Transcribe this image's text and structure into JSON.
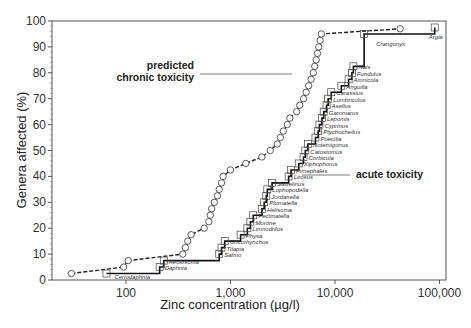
{
  "chart_data": {
    "type": "line",
    "title": "",
    "xlabel": "Zinc concentration (µg/l)",
    "ylabel": "Genera affected (%)",
    "xscale": "log",
    "xlim": [
      20,
      100000
    ],
    "ylim": [
      0,
      100
    ],
    "x_ticks": [
      100,
      1000,
      10000,
      100000
    ],
    "x_tick_labels": [
      "100",
      "1,000",
      "10,000",
      "100,000"
    ],
    "y_ticks": [
      0,
      10,
      20,
      30,
      40,
      50,
      60,
      70,
      80,
      90,
      100
    ],
    "y_tick_labels": [
      "0",
      "10",
      "20",
      "30",
      "40",
      "50",
      "60",
      "70",
      "80",
      "90",
      "100"
    ],
    "grid": false,
    "legend": "none",
    "annotations": [
      {
        "text": "predicted\nchronic toxicity",
        "target_series": "predicted chronic toxicity"
      },
      {
        "text": "acute toxicity",
        "target_series": "acute toxicity"
      }
    ],
    "series": [
      {
        "name": "acute toxicity",
        "style": "solid line, square markers",
        "points": [
          {
            "genus": "Ceriodaphnia",
            "x": 65,
            "y": 2.5
          },
          {
            "genus": "Daphnia",
            "x": 210,
            "y": 5
          },
          {
            "genus": "Aeolosoma",
            "x": 230,
            "y": 7.5
          },
          {
            "genus": "Salmo",
            "x": 780,
            "y": 10
          },
          {
            "genus": "Tilapia",
            "x": 820,
            "y": 12.5
          },
          {
            "genus": "Oncorhynchus",
            "x": 880,
            "y": 15
          },
          {
            "genus": "Physa",
            "x": 1250,
            "y": 17.5
          },
          {
            "genus": "Limnodrilus",
            "x": 1450,
            "y": 20
          },
          {
            "genus": "Morone",
            "x": 1550,
            "y": 22.5
          },
          {
            "genus": "Pectinatella",
            "x": 1650,
            "y": 25
          },
          {
            "genus": "Helisoma",
            "x": 2000,
            "y": 27.5
          },
          {
            "genus": "Plumatella",
            "x": 2100,
            "y": 30
          },
          {
            "genus": "Jordanella",
            "x": 2200,
            "y": 32.5
          },
          {
            "genus": "Lophopodella",
            "x": 2250,
            "y": 35
          },
          {
            "genus": "Salvelinus",
            "x": 2500,
            "y": 37.5
          },
          {
            "genus": "Lirceus",
            "x": 3600,
            "y": 40
          },
          {
            "genus": "Pimephales",
            "x": 3800,
            "y": 42.5
          },
          {
            "genus": "Xiphophorus",
            "x": 4500,
            "y": 45
          },
          {
            "genus": "Corbicula",
            "x": 5000,
            "y": 47.5
          },
          {
            "genus": "Catostomus",
            "x": 5200,
            "y": 50
          },
          {
            "genus": "Notemigonus",
            "x": 5500,
            "y": 52.5
          },
          {
            "genus": "Poecilia",
            "x": 6500,
            "y": 55
          },
          {
            "genus": "Ptychocheilus",
            "x": 6900,
            "y": 57.5
          },
          {
            "genus": "Cyprinus",
            "x": 7100,
            "y": 60
          },
          {
            "genus": "Lepomis",
            "x": 7500,
            "y": 62.5
          },
          {
            "genus": "Gammarus",
            "x": 7800,
            "y": 65
          },
          {
            "genus": "Asellus",
            "x": 8300,
            "y": 67.5
          },
          {
            "genus": "Lumbriculus",
            "x": 8600,
            "y": 70
          },
          {
            "genus": "Carassius",
            "x": 9200,
            "y": 72.5
          },
          {
            "genus": "Anguilla",
            "x": 11500,
            "y": 75
          },
          {
            "genus": "Amnicola",
            "x": 13500,
            "y": 77.5
          },
          {
            "genus": "Fundulus",
            "x": 14500,
            "y": 80
          },
          {
            "genus": "Nais",
            "x": 15000,
            "y": 82.5
          },
          {
            "genus": "Crangonyx",
            "x": 19000,
            "y": 95
          },
          {
            "genus": "Argia",
            "x": 90000,
            "y": 97.5
          }
        ]
      },
      {
        "name": "predicted chronic toxicity",
        "style": "dashed line, circle markers",
        "points": [
          {
            "x": 30,
            "y": 2.5
          },
          {
            "x": 95,
            "y": 5
          },
          {
            "x": 105,
            "y": 7.5
          },
          {
            "x": 350,
            "y": 10
          },
          {
            "x": 370,
            "y": 12.5
          },
          {
            "x": 390,
            "y": 15
          },
          {
            "x": 420,
            "y": 17.5
          },
          {
            "x": 560,
            "y": 20
          },
          {
            "x": 620,
            "y": 22.5
          },
          {
            "x": 640,
            "y": 25
          },
          {
            "x": 660,
            "y": 27.5
          },
          {
            "x": 700,
            "y": 30
          },
          {
            "x": 750,
            "y": 32.5
          },
          {
            "x": 780,
            "y": 35
          },
          {
            "x": 820,
            "y": 37.5
          },
          {
            "x": 850,
            "y": 40
          },
          {
            "x": 1000,
            "y": 42.5
          },
          {
            "x": 1400,
            "y": 45
          },
          {
            "x": 2000,
            "y": 47.5
          },
          {
            "x": 2400,
            "y": 50
          },
          {
            "x": 2800,
            "y": 52.5
          },
          {
            "x": 3000,
            "y": 55
          },
          {
            "x": 3200,
            "y": 57.5
          },
          {
            "x": 3500,
            "y": 60
          },
          {
            "x": 3700,
            "y": 62.5
          },
          {
            "x": 4300,
            "y": 65
          },
          {
            "x": 4600,
            "y": 67.5
          },
          {
            "x": 5000,
            "y": 70
          },
          {
            "x": 5300,
            "y": 72.5
          },
          {
            "x": 5600,
            "y": 75
          },
          {
            "x": 5900,
            "y": 77.5
          },
          {
            "x": 6200,
            "y": 80
          },
          {
            "x": 6400,
            "y": 82.5
          },
          {
            "x": 6600,
            "y": 85
          },
          {
            "x": 6800,
            "y": 87.5
          },
          {
            "x": 7000,
            "y": 90
          },
          {
            "x": 7200,
            "y": 92.5
          },
          {
            "x": 7400,
            "y": 95
          },
          {
            "x": 42000,
            "y": 97
          }
        ]
      }
    ]
  },
  "labels": {
    "y_axis_title": "Genera affected (%)",
    "x_axis_title": "Zinc concentration (µg/l)",
    "chronic_annotation_line1": "predicted",
    "chronic_annotation_line2": "chronic toxicity",
    "acute_annotation": "acute toxicity",
    "caption": "FIGURE"
  }
}
